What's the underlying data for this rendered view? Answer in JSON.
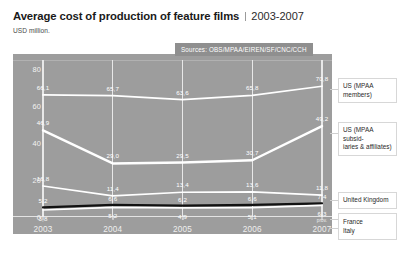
{
  "header": {
    "title": "Average cost of production of feature films",
    "period": "2003-2007",
    "subtitle": "USD million."
  },
  "sources_note": "Sources: OBS/MPAA/EIREN/SF/CNC/CCH",
  "axis": {
    "y_ticks": [
      "0",
      "20",
      "40",
      "60",
      "80"
    ],
    "x_ticks": [
      "2003",
      "2004",
      "2005",
      "2006",
      "2007"
    ],
    "prov_note": "prov."
  },
  "legend": {
    "us_members_l1": "US (MPAA",
    "us_members_l2": "members)",
    "us_subs_l1": "US (MPAA subsid-",
    "us_subs_l2": "iaries & affiliates)",
    "uk": "United Kingdom",
    "france": "France",
    "italy": "Italy"
  },
  "chart_data": {
    "type": "line",
    "title": "Average cost of production of feature films",
    "subtitle": "USD million.",
    "xlabel": "",
    "ylabel": "USD million",
    "ylim": [
      0,
      85
    ],
    "yticks": [
      0,
      20,
      40,
      60,
      80
    ],
    "grid": "vertical",
    "legend_position": "right",
    "categories": [
      "2003",
      "2004",
      "2005",
      "2006",
      "2007"
    ],
    "series": [
      {
        "name": "US (MPAA members)",
        "values": [
          66.1,
          65.7,
          63.6,
          65.8,
          70.8
        ],
        "color": "#ffffff"
      },
      {
        "name": "US (MPAA subsidiaries & affiliates)",
        "values": [
          46.9,
          29.0,
          29.5,
          30.7,
          49.2
        ],
        "color": "#ffffff"
      },
      {
        "name": "United Kingdom",
        "values": [
          16.8,
          11.4,
          13.4,
          13.6,
          11.8
        ],
        "color": "#ffffff"
      },
      {
        "name": "France",
        "values": [
          5.2,
          6.6,
          6.2,
          6.6,
          7.4
        ],
        "color": "#111111"
      },
      {
        "name": "Italy",
        "values": [
          3.8,
          5.2,
          4.9,
          5.1,
          6.3
        ],
        "color": "#ffffff"
      }
    ],
    "annotations": [
      "Sources: OBS/MPAA/EIREN/SF/CNC/CCH",
      "prov."
    ]
  }
}
